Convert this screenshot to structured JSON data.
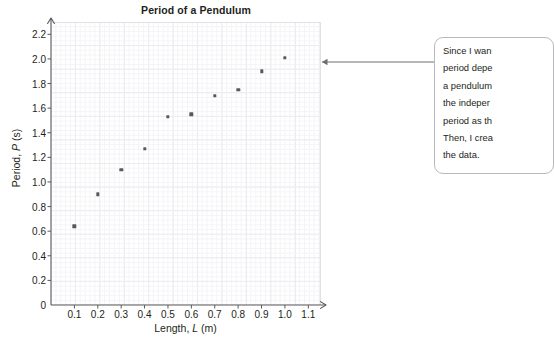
{
  "chart_data": {
    "type": "scatter",
    "title": "Period of a Pendulum",
    "xlabel_plain": "Length, L (m)",
    "xlabel_prefix": "Length, ",
    "xlabel_var": "L",
    "xlabel_suffix": " (m)",
    "ylabel_plain": "Period, P (s)",
    "ylabel_prefix": "Period, ",
    "ylabel_var": "P",
    "ylabel_suffix": " (s)",
    "x": [
      0.1,
      0.2,
      0.3,
      0.4,
      0.5,
      0.6,
      0.7,
      0.8,
      0.9,
      1.0
    ],
    "y": [
      0.64,
      0.9,
      1.1,
      1.27,
      1.53,
      1.55,
      1.7,
      1.75,
      1.9,
      2.01
    ],
    "xlim": [
      0,
      1.15
    ],
    "ylim": [
      0,
      2.3
    ],
    "xticks": [
      "0.1",
      "0.2",
      "0.3",
      "0.4",
      "0.5",
      "0.6",
      "0.7",
      "0.8",
      "0.9",
      "1.0",
      "1.1"
    ],
    "xtick_values": [
      0.1,
      0.2,
      0.3,
      0.4,
      0.5,
      0.6,
      0.7,
      0.8,
      0.9,
      1.0,
      1.1
    ],
    "yticks": [
      "0",
      "0.2",
      "0.4",
      "0.6",
      "0.8",
      "1.0",
      "1.2",
      "1.4",
      "1.6",
      "1.8",
      "2.0",
      "2.2"
    ],
    "ytick_values": [
      0,
      0.2,
      0.4,
      0.6,
      0.8,
      1.0,
      1.2,
      1.4,
      1.6,
      1.8,
      2.0,
      2.2
    ],
    "grid": true,
    "legend": "none",
    "marker_color": "#58595b",
    "grid_color": "#ebebf0",
    "axis_color": "#58595b",
    "text_color": "#231f20"
  },
  "callout": {
    "lines": [
      "Since I wan",
      "period depe",
      "a pendulum",
      "the indeper",
      "period as th",
      "Then, I crea",
      "the data."
    ],
    "border_color": "#b9b9bd",
    "arrow_color": "#6d6e71"
  }
}
